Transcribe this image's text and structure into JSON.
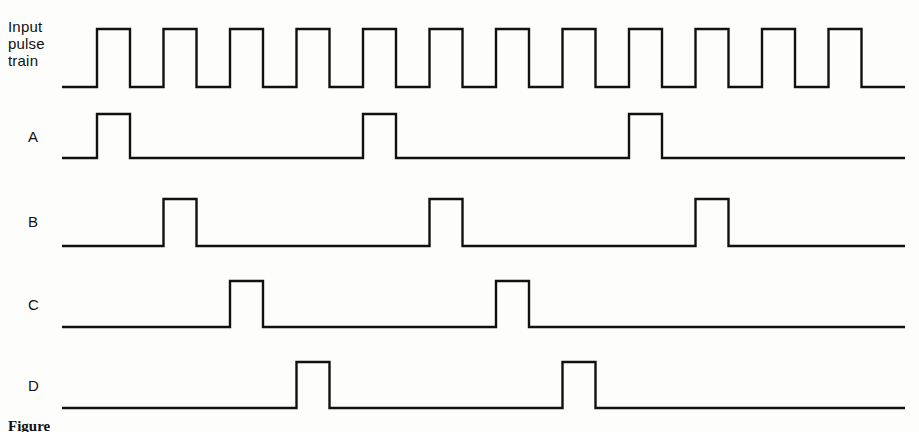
{
  "figure": {
    "caption": "Figure",
    "line_color": "#111111",
    "background_color": "#fdfdfc",
    "stroke_width": 2.4
  },
  "rows": [
    {
      "id": "input",
      "label": "Input\npulse\ntrain",
      "baseline_y": 87,
      "high_y": 29
    },
    {
      "id": "a",
      "label": "A",
      "baseline_y": 158,
      "high_y": 114
    },
    {
      "id": "b",
      "label": "B",
      "baseline_y": 246,
      "high_y": 199
    },
    {
      "id": "c",
      "label": "C",
      "baseline_y": 327,
      "high_y": 281
    },
    {
      "id": "d",
      "label": "D",
      "baseline_y": 408,
      "high_y": 362
    }
  ],
  "chart_data": {
    "type": "line",
    "xlabel": "",
    "ylabel": "",
    "timebase": {
      "start_x": 97,
      "period_px": 66.5,
      "pulse_width_px": 33,
      "lead_in_x": 62,
      "trail_out_x": 905,
      "clock_count": 12
    },
    "series": [
      {
        "name": "Input pulse train",
        "row": "input",
        "pulse_clocks": [
          1,
          2,
          3,
          4,
          5,
          6,
          7,
          8,
          9,
          10,
          11,
          12
        ],
        "values": [
          1,
          1,
          1,
          1,
          1,
          1,
          1,
          1,
          1,
          1,
          1,
          1
        ]
      },
      {
        "name": "A",
        "row": "a",
        "pulse_clocks": [
          1,
          5,
          9
        ],
        "values": [
          1,
          0,
          0,
          0,
          1,
          0,
          0,
          0,
          1,
          0,
          0,
          0
        ]
      },
      {
        "name": "B",
        "row": "b",
        "pulse_clocks": [
          2,
          6,
          10
        ],
        "values": [
          0,
          1,
          0,
          0,
          0,
          1,
          0,
          0,
          0,
          1,
          0,
          0
        ]
      },
      {
        "name": "C",
        "row": "c",
        "pulse_clocks": [
          3,
          7
        ],
        "values": [
          0,
          0,
          1,
          0,
          0,
          0,
          1,
          0,
          0,
          0,
          0,
          0
        ]
      },
      {
        "name": "D",
        "row": "d",
        "pulse_clocks": [
          4,
          8
        ],
        "values": [
          0,
          0,
          0,
          1,
          0,
          0,
          0,
          1,
          0,
          0,
          0,
          0
        ]
      }
    ],
    "legend_position": "left-labels",
    "grid": false
  }
}
